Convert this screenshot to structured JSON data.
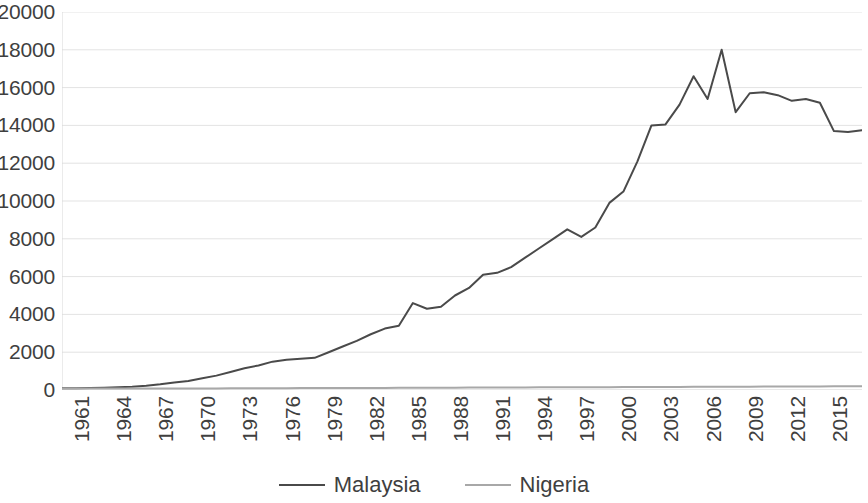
{
  "chart_data": {
    "type": "line",
    "title": "",
    "subtitle": "",
    "xlabel": "",
    "ylabel": "",
    "xlim": [
      1961,
      2018
    ],
    "ylim": [
      0,
      20000
    ],
    "grid": true,
    "legend_position": "bottom",
    "y_ticks": [
      0,
      2000,
      4000,
      6000,
      8000,
      10000,
      12000,
      14000,
      16000,
      18000,
      20000
    ],
    "y_tick_labels": [
      "0",
      "2000",
      "4000",
      "6000",
      "8000",
      "10000",
      "12000",
      "14000",
      "16000",
      "18000",
      "20000"
    ],
    "x_ticks": [
      1961,
      1964,
      1967,
      1970,
      1973,
      1976,
      1979,
      1982,
      1985,
      1988,
      1991,
      1994,
      1997,
      2000,
      2003,
      2006,
      2009,
      2012,
      2015,
      2018
    ],
    "x_tick_labels": [
      "1961",
      "1964",
      "1967",
      "1970",
      "1973",
      "1976",
      "1979",
      "1982",
      "1985",
      "1988",
      "1991",
      "1994",
      "1997",
      "2000",
      "2003",
      "2006",
      "2009",
      "2012",
      "2015",
      "2018"
    ],
    "x": [
      1961,
      1962,
      1963,
      1964,
      1965,
      1966,
      1967,
      1968,
      1969,
      1970,
      1971,
      1972,
      1973,
      1974,
      1975,
      1976,
      1977,
      1978,
      1979,
      1980,
      1981,
      1982,
      1983,
      1984,
      1985,
      1986,
      1987,
      1988,
      1989,
      1990,
      1991,
      1992,
      1993,
      1994,
      1995,
      1996,
      1997,
      1998,
      1999,
      2000,
      2001,
      2002,
      2003,
      2004,
      2005,
      2006,
      2007,
      2008,
      2009,
      2010,
      2011,
      2012,
      2013,
      2014,
      2015,
      2016,
      2017,
      2018
    ],
    "series": [
      {
        "name": "Malaysia",
        "color": "#4a4a4a",
        "values": [
          90,
          95,
          105,
          120,
          140,
          170,
          220,
          300,
          400,
          480,
          620,
          760,
          950,
          1150,
          1300,
          1500,
          1600,
          1650,
          1700,
          2000,
          2300,
          2600,
          2950,
          3250,
          3400,
          4600,
          4300,
          4400,
          5000,
          5400,
          6100,
          6200,
          6500,
          7000,
          7500,
          8000,
          8500,
          8100,
          8600,
          9900,
          10500,
          12100,
          14000,
          14050,
          15100,
          16600,
          15400,
          18000,
          14700,
          15700,
          15750,
          15600,
          15300,
          15400,
          15200,
          13700,
          13650,
          13750
        ]
      },
      {
        "name": "Nigeria",
        "color": "#a8a8a8",
        "values": [
          75,
          75,
          78,
          78,
          80,
          80,
          80,
          80,
          82,
          82,
          85,
          85,
          88,
          90,
          92,
          95,
          98,
          100,
          102,
          105,
          108,
          110,
          110,
          112,
          115,
          118,
          120,
          122,
          125,
          128,
          130,
          132,
          135,
          138,
          140,
          142,
          145,
          148,
          150,
          152,
          155,
          158,
          160,
          162,
          165,
          168,
          170,
          172,
          175,
          178,
          180,
          182,
          185,
          188,
          190,
          192,
          195,
          198
        ]
      }
    ]
  },
  "legend": {
    "items": [
      {
        "label": "Malaysia",
        "color": "#4a4a4a"
      },
      {
        "label": "Nigeria",
        "color": "#a8a8a8"
      }
    ]
  }
}
